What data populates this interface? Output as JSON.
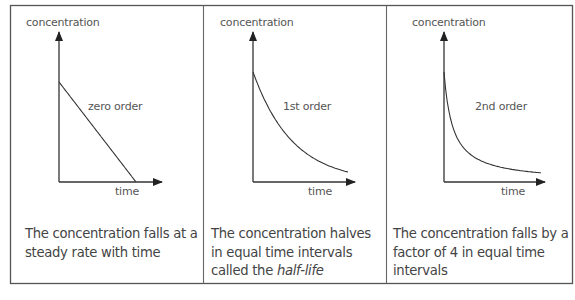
{
  "chart_data": [
    {
      "type": "line",
      "title": "zero order",
      "xlabel": "time",
      "ylabel": "concentration",
      "curve": "linear",
      "description": "The concentration falls at a steady rate with time"
    },
    {
      "type": "line",
      "title": "1st order",
      "xlabel": "time",
      "ylabel": "concentration",
      "curve": "exponential decay",
      "description_parts": [
        "The concentration halves in equal time intervals called the ",
        "half-life"
      ]
    },
    {
      "type": "line",
      "title": "2nd order",
      "xlabel": "time",
      "ylabel": "concentration",
      "curve": "inverse decay",
      "description": "The concentration falls by a factor of 4 in equal time intervals"
    }
  ],
  "colors": {
    "border": "#555555",
    "axis": "#3a3a3a",
    "text": "#444444"
  }
}
